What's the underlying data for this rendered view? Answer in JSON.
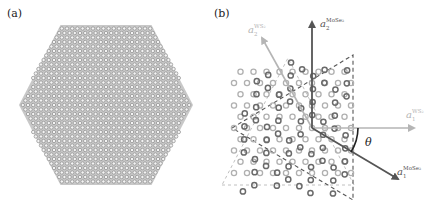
{
  "panels": [
    {
      "id": "a",
      "label": "(a)",
      "description": "Hexagonal bilayer flake, honeycomb lattice"
    },
    {
      "id": "b",
      "label": "(b)",
      "description": "Twisted bilayer lattice vectors",
      "vectors": [
        {
          "name": "a2_MoSe2",
          "symbol": "a",
          "sub": "2",
          "sup": "MoSe₂",
          "color": "#555555"
        },
        {
          "name": "a2_WS2",
          "symbol": "a",
          "sub": "2",
          "sup": "WS₂",
          "color": "#b5b5b5"
        },
        {
          "name": "a1_WS2",
          "symbol": "a",
          "sub": "1",
          "sup": "WS₂",
          "color": "#b5b5b5"
        },
        {
          "name": "a1_MoSe2",
          "symbol": "a",
          "sub": "1",
          "sup": "MoSe₂",
          "color": "#555555"
        }
      ],
      "angle_label": "θ"
    }
  ],
  "colors": {
    "lattice_dark": "#6a6a6a",
    "lattice_light": "#b0b0b0",
    "dash_dark": "#555555",
    "dash_light": "#c0c0c0"
  }
}
